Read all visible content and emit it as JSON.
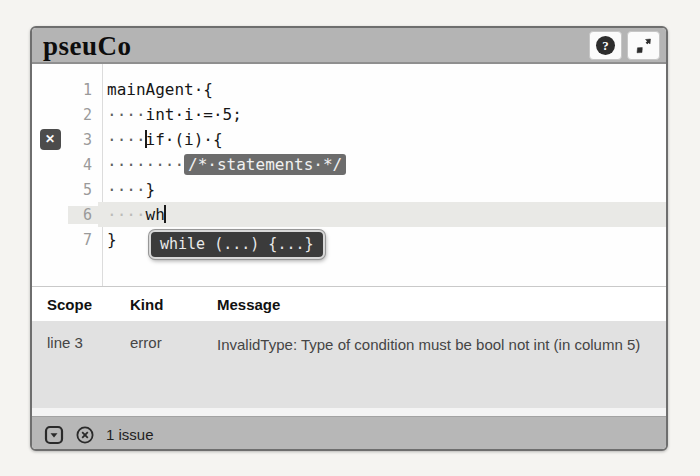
{
  "app": {
    "title": "pseuCo"
  },
  "header": {
    "help_glyph": "?"
  },
  "editor": {
    "error_marker_glyph": "✕",
    "lines": [
      {
        "no": "1",
        "ws": "",
        "code": "mainAgent·{"
      },
      {
        "no": "2",
        "ws": "····",
        "code": "int·i·=·5;"
      },
      {
        "no": "3",
        "ws": "····",
        "code": "if·(i)·{"
      },
      {
        "no": "4",
        "ws": "········",
        "selection": "/*·statements·*/"
      },
      {
        "no": "5",
        "ws": "····",
        "code": "}"
      },
      {
        "no": "6",
        "ws": "····",
        "code": "wh"
      },
      {
        "no": "7",
        "ws": "",
        "code": "}"
      }
    ],
    "autocomplete": {
      "label": "while (...) {...}"
    }
  },
  "issues": {
    "columns": [
      "Scope",
      "Kind",
      "Message"
    ],
    "rows": [
      {
        "scope": "line 3",
        "kind": "error",
        "message": "InvalidType: Type of condition must be bool not int (in column 5)"
      }
    ]
  },
  "footer": {
    "count_label": "1 issue"
  }
}
